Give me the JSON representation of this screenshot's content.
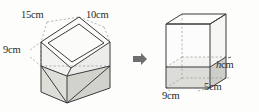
{
  "figure": {
    "type": "geometry-diagram",
    "background_color": "#fdfdfc",
    "line_color": "#3c3c3c",
    "dashed_color": "#8c8c8c",
    "shade_color": "#d8d8d4",
    "left_solid": {
      "name": "tilted-cuboid",
      "labels": [
        {
          "id": "length",
          "text": "15cm"
        },
        {
          "id": "width",
          "text": "10cm"
        },
        {
          "id": "height",
          "text": "9cm"
        }
      ]
    },
    "arrow": {
      "name": "transform-arrow",
      "glyph": "right-arrow",
      "color": "#6e6e6e"
    },
    "right_solid": {
      "name": "upright-cuboid",
      "labels": [
        {
          "id": "depth-h",
          "text_italic": "h",
          "text_unit": "cm"
        },
        {
          "id": "base-length",
          "text": "9cm"
        },
        {
          "id": "base-width",
          "text": "5cm"
        }
      ]
    }
  }
}
